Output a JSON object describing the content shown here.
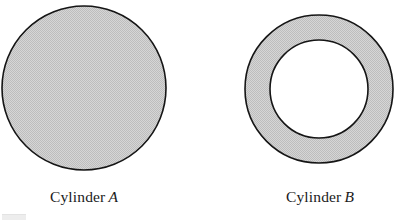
{
  "figure": {
    "background_color": "#ffffff",
    "stroke_color": "#151515",
    "fill_color": "#cbcbcb",
    "shapes": [
      {
        "id": "cylinder-a",
        "kind": "solid-disk",
        "cx": 84,
        "cy": 88,
        "r_outer": 82,
        "r_inner": 0
      },
      {
        "id": "cylinder-b",
        "kind": "annulus",
        "cx": 319,
        "cy": 89,
        "r_outer": 74,
        "r_inner": 49
      }
    ]
  },
  "captions": {
    "left": {
      "word": "Cylinder",
      "symbol": "A"
    },
    "right": {
      "word": "Cylinder",
      "symbol": "B"
    }
  }
}
